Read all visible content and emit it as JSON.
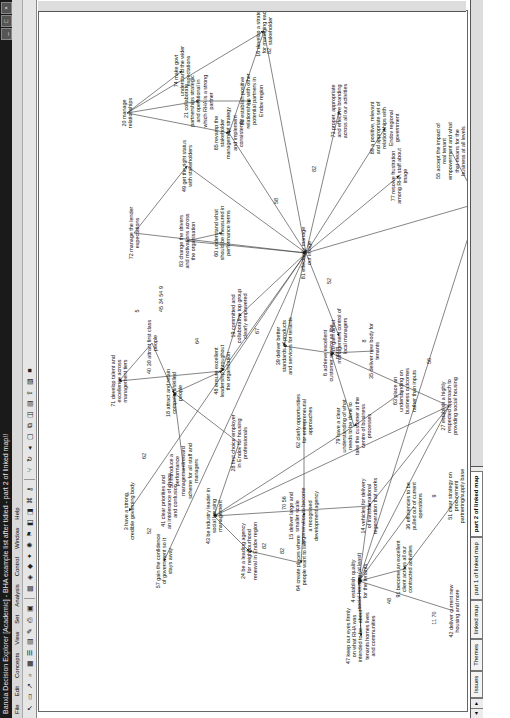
{
  "window": {
    "title": "Banxia Decision Explorer [Academic] - BHA example list after tidied - part 2 of linked map!!",
    "buttons": [
      "_",
      "□",
      "×"
    ]
  },
  "menu": [
    "File",
    "Edit",
    "Concepts",
    "View",
    "Set",
    "Analysis",
    "Control",
    "Window",
    "Help"
  ],
  "toolbar": {
    "icons": [
      "pointer-icon",
      "concept-icon",
      "link-icon",
      "zoom-icon",
      "grid-icon",
      "list-icon",
      "map-icon",
      "style-icon",
      "print-icon",
      "preview-icon",
      "table-icon",
      "explore-icon",
      "domain-icon",
      "central-icon",
      "cluster-icon",
      "potent-icon",
      "set-icon",
      "hieset-icon",
      "tag-icon",
      "key-icon",
      "branch-icon",
      "loop-icon",
      "back-icon",
      "map-view-icon",
      "window-icon",
      "group-icon",
      "layout-icon",
      "export-icon",
      "picture-icon",
      "stop-icon"
    ]
  },
  "tabs": {
    "items": [
      "Issues",
      "Themes",
      "linked map",
      "part 1 of linked map",
      "part 2 of linked map"
    ],
    "active": "part 2 of linked map"
  },
  "map": {
    "nodes": [
      {
        "id": "20",
        "text": "20 manage relationships",
        "x": 598,
        "y": 88
      },
      {
        "id": "21",
        "text": "21 collaborate partnerships strategic and operational in which RHA is a strong partner",
        "x": 610,
        "y": 160
      },
      {
        "id": "88",
        "text": "88 establish positive relationships with other potential partners in Endov region",
        "x": 610,
        "y": 212
      },
      {
        "id": "74",
        "text": "74 make govt understand the wider expectations",
        "x": 640,
        "y": 143
      },
      {
        "id": "16",
        "text": "16 develop a strategy for managing each stakeholder",
        "x": 680,
        "y": 225
      },
      {
        "id": "72",
        "text": "72 manage the lender expectations",
        "x": 478,
        "y": 95
      },
      {
        "id": "49",
        "text": "49 get the right status with stakeholders",
        "x": 545,
        "y": 148
      },
      {
        "id": "85",
        "text": "85 revamp the stakeholder management strategy and implement consistently",
        "x": 578,
        "y": 190
      },
      {
        "id": "73",
        "text": "73 proper, appropriate and effective branding across all our activities",
        "x": 600,
        "y": 300
      },
      {
        "id": "83",
        "text": "83 change the drivers and motivations across the organisation",
        "x": 470,
        "y": 148
      },
      {
        "id": "60",
        "text": "60 understand what should be measured in performance terms",
        "x": 478,
        "y": 183
      },
      {
        "id": "30",
        "text": "30 attract first class people",
        "x": 368,
        "y": 113
      },
      {
        "id": "71",
        "text": "71 develop talent and excellence across management tiers",
        "x": 330,
        "y": 80
      },
      {
        "id": "18",
        "text": "18 attract and retain competent/skilled people",
        "x": 318,
        "y": 135
      },
      {
        "id": "48",
        "text": "48 ensure excellent leadership throughout the organisation",
        "x": 340,
        "y": 183
      },
      {
        "id": "19",
        "text": "19 committed and collaborative top group clearly empowered",
        "x": 395,
        "y": 200
      },
      {
        "id": "81",
        "text": "81 effectively manage our image",
        "x": 458,
        "y": 267
      },
      {
        "id": "77",
        "text": "77 resolve frustration among RHA staff about image",
        "x": 535,
        "y": 360
      },
      {
        "id": "89",
        "text": "89 a positive, relevant and appropriate set of relationships with Endov regional government",
        "x": 583,
        "y": 346
      },
      {
        "id": "55",
        "text": "55 accept the impact of real tenant empowerment and what that means for the business at all levels",
        "x": 560,
        "y": 412
      },
      {
        "id": "23",
        "text": "23 ensure tenant participation truly results in outcomes",
        "x": 508,
        "y": 440
      },
      {
        "id": "10",
        "text": "10 gain direct management control of local managers",
        "x": 375,
        "y": 300
      },
      {
        "id": "39",
        "text": "39 deliver better standards of products and services for tenants",
        "x": 365,
        "y": 245
      },
      {
        "id": "6",
        "text": "6 achieve excellent customer service as the norm",
        "x": 358,
        "y": 292
      },
      {
        "id": "35",
        "text": "35 deliver new body for tenants",
        "x": 360,
        "y": 335
      },
      {
        "id": "62",
        "text": "62 clarify opportunities for entrepreneurial approaches",
        "x": 290,
        "y": 265
      },
      {
        "id": "79",
        "text": "79 have a clear understanding of what needs to be done to take the customer at the centre of business processes",
        "x": 285,
        "y": 315
      },
      {
        "id": "63",
        "text": "63 place an understanding on business outcomes rather than inputs",
        "x": 320,
        "y": 365
      },
      {
        "id": "27",
        "text": "27 establish a highly respected approach to providing social housing",
        "x": 305,
        "y": 410
      },
      {
        "id": "28",
        "text": "28 first choice employer in Endov for housing professionals",
        "x": 268,
        "y": 200
      },
      {
        "id": "50",
        "text": "50 introduce a performance management/reward scheme for all staff and managers",
        "x": 240,
        "y": 145
      },
      {
        "id": "3",
        "text": "3 have a strong, credible governing body",
        "x": 200,
        "y": 90
      },
      {
        "id": "41",
        "text": "41 clear priorities and an intolerance of chaos and confusion",
        "x": 210,
        "y": 130
      },
      {
        "id": "43",
        "text": "43 be industry leader in social housing management",
        "x": 195,
        "y": 175
      },
      {
        "id": "15",
        "text": "15 deliver large and smaller scale regeneration to become a recognised development agency",
        "x": 195,
        "y": 265
      },
      {
        "id": "14",
        "text": "14 vehicles for delivery of transformational regeneration that works",
        "x": 205,
        "y": 330
      },
      {
        "id": "57",
        "text": "57 gain the confidence of government so it stays away",
        "x": 150,
        "y": 125
      },
      {
        "id": "24",
        "text": "24 be a leading agency for neighbourhood renewal in Endov region",
        "x": 160,
        "y": 210
      },
      {
        "id": "64",
        "text": "64 create places where people want to live",
        "x": 148,
        "y": 262
      },
      {
        "id": "4",
        "text": "4 establish quality social housing (at least) for the tenants",
        "x": 130,
        "y": 320
      },
      {
        "id": "47",
        "text": "47 keep our eyes firmly on what RHA was intended to be - about tenants homes lives and communities",
        "x": 75,
        "y": 322
      },
      {
        "id": "91",
        "text": "91 become an excellent client across all our contracted activities",
        "x": 142,
        "y": 365
      },
      {
        "id": "36",
        "text": "36 efficiencies to be pulled out of current operations",
        "x": 205,
        "y": 375
      },
      {
        "id": "42",
        "text": "42 deliver current new housing and more",
        "x": 100,
        "y": 415
      },
      {
        "id": "51",
        "text": "51 clear strategy on procurement partnering/supply base management",
        "x": 215,
        "y": 420
      }
    ],
    "tags": [
      {
        "text": "82",
        "x": 660,
        "y": 230
      },
      {
        "text": "52",
        "x": 430,
        "y": 290
      },
      {
        "text": "82",
        "x": 542,
        "y": 275
      },
      {
        "text": "82",
        "x": 535,
        "y": 482
      },
      {
        "text": "8",
        "x": 530,
        "y": 487
      },
      {
        "text": "58",
        "x": 510,
        "y": 237
      },
      {
        "text": "5",
        "x": 400,
        "y": 98
      },
      {
        "text": "45 34 54 9",
        "x": 412,
        "y": 122
      },
      {
        "text": "64",
        "x": 370,
        "y": 158
      },
      {
        "text": "40",
        "x": 340,
        "y": 110
      },
      {
        "text": "67",
        "x": 380,
        "y": 218
      },
      {
        "text": "8",
        "x": 370,
        "y": 325
      },
      {
        "text": "56",
        "x": 350,
        "y": 390
      },
      {
        "text": "70 56",
        "x": 208,
        "y": 245
      },
      {
        "text": "82",
        "x": 160,
        "y": 243
      },
      {
        "text": "82",
        "x": 165,
        "y": 225
      },
      {
        "text": "62",
        "x": 255,
        "y": 105
      },
      {
        "text": "48",
        "x": 110,
        "y": 350
      },
      {
        "text": "11 70",
        "x": 93,
        "y": 395
      },
      {
        "text": "9",
        "x": 215,
        "y": 395
      },
      {
        "text": "52",
        "x": 180,
        "y": 110
      }
    ],
    "links": [
      [
        598,
        88,
        640,
        143
      ],
      [
        598,
        88,
        610,
        160
      ],
      [
        610,
        160,
        610,
        212
      ],
      [
        598,
        88,
        680,
        225
      ],
      [
        598,
        88,
        578,
        190
      ],
      [
        478,
        95,
        545,
        148
      ],
      [
        478,
        95,
        458,
        267
      ],
      [
        545,
        148,
        458,
        267
      ],
      [
        578,
        190,
        458,
        267
      ],
      [
        680,
        225,
        458,
        267
      ],
      [
        680,
        225,
        578,
        190
      ],
      [
        470,
        148,
        478,
        183
      ],
      [
        470,
        148,
        458,
        267
      ],
      [
        368,
        113,
        330,
        80
      ],
      [
        368,
        113,
        318,
        135
      ],
      [
        318,
        135,
        340,
        183
      ],
      [
        340,
        183,
        330,
        80
      ],
      [
        395,
        200,
        340,
        183
      ],
      [
        458,
        267,
        340,
        183
      ],
      [
        458,
        267,
        395,
        200
      ],
      [
        458,
        267,
        365,
        245
      ],
      [
        458,
        267,
        375,
        300
      ],
      [
        458,
        267,
        535,
        360
      ],
      [
        458,
        267,
        583,
        346
      ],
      [
        458,
        267,
        600,
        300
      ],
      [
        458,
        267,
        508,
        440
      ],
      [
        560,
        412,
        508,
        440
      ],
      [
        358,
        292,
        365,
        245
      ],
      [
        360,
        335,
        358,
        292
      ],
      [
        285,
        315,
        358,
        292
      ],
      [
        290,
        265,
        195,
        265
      ],
      [
        285,
        315,
        195,
        175
      ],
      [
        305,
        410,
        358,
        292
      ],
      [
        305,
        410,
        195,
        175
      ],
      [
        305,
        410,
        130,
        320
      ],
      [
        305,
        410,
        205,
        330
      ],
      [
        320,
        365,
        285,
        315
      ],
      [
        268,
        200,
        318,
        135
      ],
      [
        240,
        145,
        318,
        135
      ],
      [
        268,
        200,
        195,
        175
      ],
      [
        458,
        267,
        150,
        125
      ],
      [
        205,
        330,
        130,
        320
      ],
      [
        195,
        265,
        148,
        262
      ],
      [
        148,
        262,
        160,
        210
      ],
      [
        142,
        365,
        130,
        320
      ],
      [
        205,
        375,
        130,
        320
      ],
      [
        100,
        415,
        130,
        320
      ],
      [
        75,
        322,
        130,
        320
      ],
      [
        215,
        420,
        142,
        365
      ],
      [
        458,
        267,
        200,
        90
      ],
      [
        195,
        175,
        160,
        210
      ],
      [
        205,
        330,
        195,
        175
      ],
      [
        508,
        440,
        130,
        320
      ],
      [
        130,
        320,
        75,
        322
      ]
    ]
  }
}
